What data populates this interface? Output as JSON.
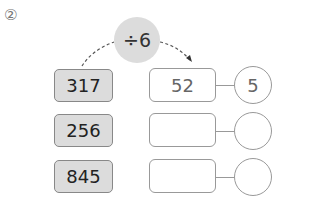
{
  "problem_number": "②",
  "operation": "÷6",
  "rows": [
    {
      "dividend": "317",
      "quotient": "52",
      "remainder": "5"
    },
    {
      "dividend": "256",
      "quotient": "",
      "remainder": ""
    },
    {
      "dividend": "845",
      "quotient": "",
      "remainder": ""
    }
  ]
}
